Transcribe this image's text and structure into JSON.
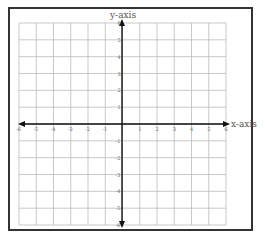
{
  "chart_data": {
    "type": "coordinate-grid",
    "title": "",
    "xlabel": "x-axis",
    "ylabel": "y-axis",
    "xlim": [
      -6,
      6
    ],
    "ylim": [
      -6,
      6
    ],
    "grid": true,
    "x_ticks": [
      "-6",
      "-5",
      "-4",
      "-3",
      "-2",
      "-1",
      "1",
      "2",
      "3",
      "4",
      "5",
      "6"
    ],
    "y_ticks": [
      "6",
      "5",
      "4",
      "3",
      "2",
      "1",
      "-1",
      "-2",
      "-3",
      "-4",
      "-5",
      "-6"
    ]
  },
  "labels": {
    "x_axis": "x-axis",
    "y_axis": "y-axis"
  },
  "colors": {
    "grid": "#bbbbbb",
    "axis": "#111111",
    "frame": "#333333"
  }
}
